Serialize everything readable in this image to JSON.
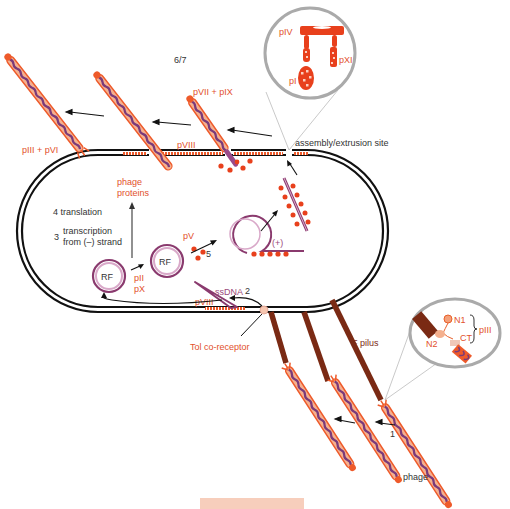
{
  "diagram": {
    "step_labels": {
      "step_6_7": "6/7",
      "step_1": "1",
      "step_2": "2",
      "step_3_num": "3",
      "step_3_line1": "transcription",
      "step_3_line2": "from (–) strand",
      "step_4": "4 translation",
      "step_5": "5"
    },
    "labels": {
      "pIII_pVI": "pIII + pVI",
      "pVII_pIX": "pVII + pIX",
      "pVIII_top": "pVIII",
      "assembly_site": "assembly/extrusion site",
      "phage_proteins_1": "phage",
      "phage_proteins_2": "proteins",
      "pV": "pV",
      "plus_strand": "(+)",
      "RF_left": "RF",
      "RF_right": "RF",
      "pII": "pII",
      "pX": "pX",
      "ssDNA": "ssDNA",
      "pVIII_bottom": "pVIII",
      "tol_receptor": "Tol co-receptor",
      "f_pilus": "F pilus",
      "phage": "phage"
    },
    "inset_top": {
      "pIV": "pIV",
      "pI": "pI",
      "pXI": "pXI"
    },
    "inset_right": {
      "N1": "N1",
      "N2": "N2",
      "CT": "CT",
      "pIII": "pIII"
    },
    "colors": {
      "membrane": "#111111",
      "phage_orange": "#ee5a2a",
      "phage_purple": "#7a3a7a",
      "dna_purple": "#8a3a6e",
      "dna_light": "#d9a9c9",
      "pilus": "#7a2a14",
      "protein_red": "#e8401c",
      "inset_gray": "#aaaaaa",
      "label_red": "#e2502c",
      "bottom_bar": "#f6c6b0"
    }
  }
}
